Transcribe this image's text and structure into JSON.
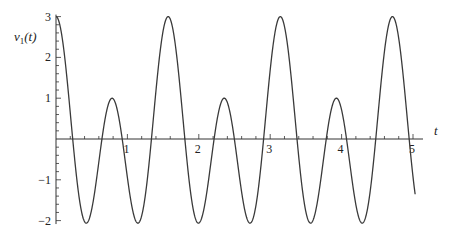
{
  "chart_data": {
    "type": "line",
    "title": "",
    "xlabel": "t",
    "ylabel": "v_1(t)",
    "ylabel_parts": {
      "base": "v",
      "sub": "1",
      "arg": "(t)"
    },
    "function": "v1(t) = cos(4t) + 2 cos(8t)",
    "xlim": [
      0,
      5.03
    ],
    "ylim": [
      -2.06,
      3
    ],
    "x_ticks": [
      1,
      2,
      3,
      4,
      5
    ],
    "x_tick_labels": [
      "1",
      "2",
      "3",
      "4",
      "5"
    ],
    "y_ticks": [
      -2,
      -1,
      1,
      2,
      3
    ],
    "y_tick_labels": [
      "−2",
      "−1",
      "1",
      "2",
      "3"
    ],
    "grid": false,
    "legend": null,
    "series": [
      {
        "name": "v1(t)",
        "x": [
          0,
          0.2,
          0.4,
          0.6,
          0.785,
          1.0,
          1.2,
          1.4,
          1.571,
          1.8,
          2.0,
          2.2,
          2.356,
          2.6,
          2.8,
          3.0,
          3.142,
          3.4,
          3.6,
          3.8,
          3.927,
          4.2,
          4.4,
          4.6,
          4.712,
          4.9,
          5.03
        ],
        "values": [
          3.0,
          -0.1,
          -1.82,
          -0.27,
          1.0,
          -0.94,
          -1.9,
          2.33,
          3.0,
          0.04,
          -1.61,
          -0.95,
          1.0,
          -0.22,
          -2.03,
          1.18,
          3.0,
          0.96,
          -0.68,
          -1.59,
          1.0,
          -1.54,
          -1.69,
          2.81,
          3.0,
          -0.49,
          -1.35
        ],
        "key_points": {
          "major_peaks": [
            [
              0,
              3
            ],
            [
              1.571,
              3
            ],
            [
              3.142,
              3
            ],
            [
              4.712,
              3
            ]
          ],
          "minor_peaks": [
            [
              0.785,
              1
            ],
            [
              2.356,
              1
            ],
            [
              3.927,
              1
            ]
          ],
          "minima_value": -2.06
        }
      }
    ],
    "colors": {
      "curve": "#3a3a3a",
      "axes": "#333333",
      "background": "#ffffff"
    }
  },
  "layout": {
    "origin_px": [
      56,
      139
    ],
    "px_per_x": 71.4,
    "px_per_y": 40.8,
    "x_axis_end_px": 423,
    "y_minor_step": 0.2,
    "x_minor_step": 0.2
  }
}
